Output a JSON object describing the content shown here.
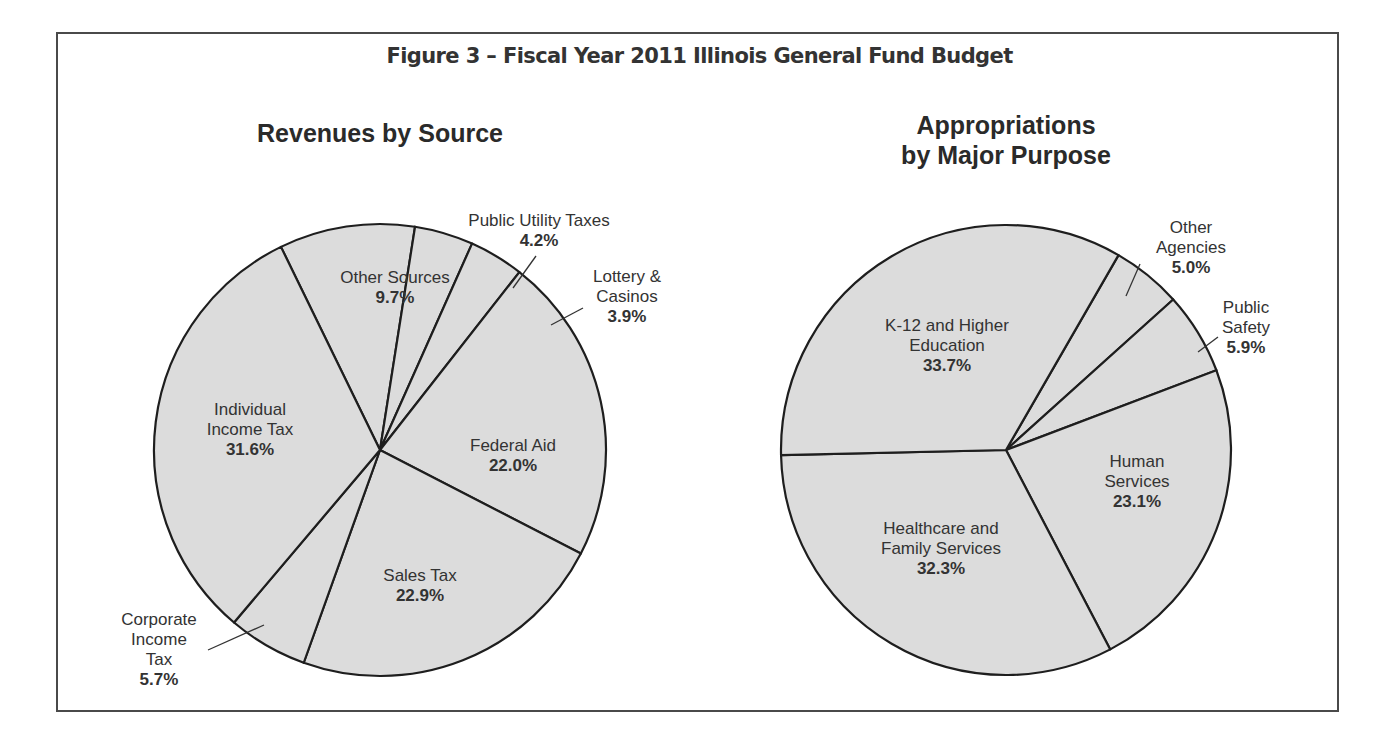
{
  "figure": {
    "title": "Figure 3 – Fiscal Year 2011 Illinois General Fund Budget"
  },
  "colors": {
    "slice_fill": "#dcdcdc",
    "slice_stroke": "#1e1e1e",
    "frame": "#4a4a4a",
    "text": "#2b2b2b"
  },
  "chart_data": [
    {
      "type": "pie",
      "title": "Revenues by Source",
      "categories": [
        "Other Sources",
        "Public Utility Taxes",
        "Lottery & Casinos",
        "Federal Aid",
        "Sales Tax",
        "Corporate Income Tax",
        "Individual Income Tax"
      ],
      "values": [
        9.7,
        4.2,
        3.9,
        22.0,
        22.9,
        5.7,
        31.6
      ],
      "unit": "%",
      "labels": [
        {
          "lines": [
            "Other Sources"
          ],
          "pct": "9.7%"
        },
        {
          "lines": [
            "Public Utility Taxes"
          ],
          "pct": "4.2%"
        },
        {
          "lines": [
            "Lottery &",
            "Casinos"
          ],
          "pct": "3.9%"
        },
        {
          "lines": [
            "Federal Aid"
          ],
          "pct": "22.0%"
        },
        {
          "lines": [
            "Sales Tax"
          ],
          "pct": "22.9%"
        },
        {
          "lines": [
            "Corporate",
            "Income",
            "Tax"
          ],
          "pct": "5.7%"
        },
        {
          "lines": [
            "Individual",
            "Income Tax"
          ],
          "pct": "31.6%"
        }
      ]
    },
    {
      "type": "pie",
      "title": "Appropriations by Major Purpose",
      "title_lines": [
        "Appropriations",
        "by Major Purpose"
      ],
      "categories": [
        "Other Agencies",
        "Public Safety",
        "Human Services",
        "Healthcare and Family Services",
        "K-12 and Higher Education"
      ],
      "values": [
        5.0,
        5.9,
        23.1,
        32.3,
        33.7
      ],
      "unit": "%",
      "labels": [
        {
          "lines": [
            "Other",
            "Agencies"
          ],
          "pct": "5.0%"
        },
        {
          "lines": [
            "Public",
            "Safety"
          ],
          "pct": "5.9%"
        },
        {
          "lines": [
            "Human",
            "Services"
          ],
          "pct": "23.1%"
        },
        {
          "lines": [
            "Healthcare and",
            "Family Services"
          ],
          "pct": "32.3%"
        },
        {
          "lines": [
            "K-12 and Higher",
            "Education"
          ],
          "pct": "33.7%"
        }
      ]
    }
  ]
}
